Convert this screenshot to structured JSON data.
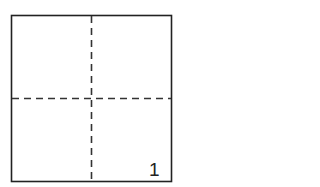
{
  "diagram": {
    "type": "folded-square",
    "panel_number": "1",
    "colors": {
      "stroke": "#222222",
      "fold_line": "#333333",
      "background": "#ffffff"
    }
  }
}
